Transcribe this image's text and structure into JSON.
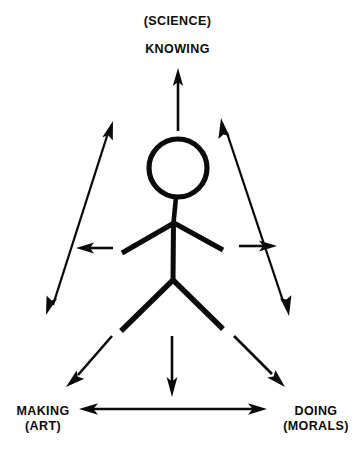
{
  "diagram": {
    "title_top_paren": "(SCIENCE)",
    "title_top": "KNOWING",
    "label_bottom_left": "MAKING",
    "label_bottom_left_paren": "(ART)",
    "label_bottom_right": "DOING",
    "label_bottom_right_paren": "(MORALS)",
    "ink_color": "#0b0b0b",
    "background_color": "#ffffff",
    "figure": {
      "name": "stick-figure",
      "head_center_x": 178,
      "head_center_y": 168,
      "head_radius": 29,
      "neck_top_y": 197,
      "shoulder_x": 173,
      "shoulder_y": 222,
      "arm_left_end_x": 122,
      "arm_left_end_y": 253,
      "arm_right_end_x": 223,
      "arm_right_end_y": 250,
      "hip_x": 173,
      "hip_y": 281,
      "leg_left_end_x": 121,
      "leg_left_end_y": 331,
      "leg_right_end_x": 223,
      "leg_right_end_y": 329
    },
    "arrows": [
      {
        "name": "arrow-up-knowing",
        "heads": "single",
        "from_x": 178,
        "from_y": 131,
        "to_x": 178,
        "to_y": 70
      },
      {
        "name": "arrow-diagonal-upper-left",
        "heads": "double",
        "from_x": 47,
        "from_y": 312,
        "to_x": 113,
        "to_y": 124
      },
      {
        "name": "arrow-diagonal-upper-right",
        "heads": "double",
        "from_x": 222,
        "from_y": 120,
        "to_x": 288,
        "to_y": 312
      },
      {
        "name": "arrow-short-left",
        "heads": "single",
        "from_x": 112,
        "from_y": 248,
        "to_x": 77,
        "to_y": 248
      },
      {
        "name": "arrow-short-right",
        "heads": "single",
        "from_x": 240,
        "from_y": 246,
        "to_x": 276,
        "to_y": 246
      },
      {
        "name": "arrow-down-center",
        "heads": "single",
        "from_x": 172,
        "from_y": 336,
        "to_x": 172,
        "to_y": 396
      },
      {
        "name": "arrow-down-left-making",
        "heads": "single",
        "from_x": 111,
        "from_y": 337,
        "to_x": 68,
        "to_y": 386
      },
      {
        "name": "arrow-down-right-doing",
        "heads": "single",
        "from_x": 234,
        "from_y": 337,
        "to_x": 284,
        "to_y": 386
      },
      {
        "name": "arrow-horizontal-making-doing",
        "heads": "double",
        "from_x": 80,
        "from_y": 409,
        "to_x": 266,
        "to_y": 409
      }
    ]
  }
}
